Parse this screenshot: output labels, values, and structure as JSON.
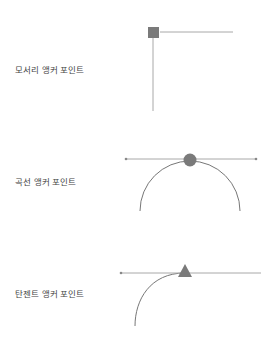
{
  "diagram": {
    "colors": {
      "line": "#a8a8a8",
      "curve": "#777777",
      "anchor": "#7a7a7a",
      "text": "#444444"
    },
    "items": [
      {
        "label": "모서리 앵커 포인트",
        "anchor_shape": "square"
      },
      {
        "label": "곡선 앵커 포인트",
        "anchor_shape": "circle"
      },
      {
        "label": "탄젠트 앵커 포인트",
        "anchor_shape": "triangle"
      }
    ]
  }
}
